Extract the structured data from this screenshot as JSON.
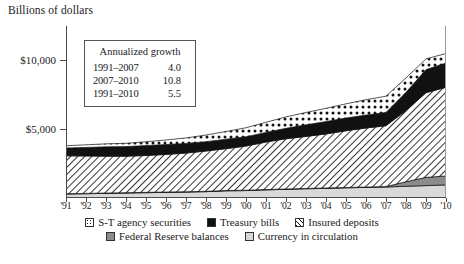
{
  "axis_title": "Billions of dollars",
  "growth_box": {
    "title": "Annualized growth",
    "rows": [
      {
        "period": "1991–2007",
        "value": "4.0"
      },
      {
        "period": "2007–2010",
        "value": "10.8"
      },
      {
        "period": "1991–2010",
        "value": "5.5"
      }
    ]
  },
  "legend": {
    "row1": [
      {
        "label": "S-T agency securities",
        "swatch": "dotted-icon"
      },
      {
        "label": "Treasury bills",
        "swatch": "black-square-icon"
      },
      {
        "label": "Insured deposits",
        "swatch": "hatch-icon"
      }
    ],
    "row2": [
      {
        "label": "Federal Reserve balances",
        "swatch": "dark-gray-square-icon"
      },
      {
        "label": "Currency in circulation",
        "swatch": "light-gray-square-icon"
      }
    ]
  },
  "chart_data": {
    "type": "area",
    "title": "",
    "xlabel": "",
    "ylabel": "Billions of dollars",
    "stacked": true,
    "grid": false,
    "legend_position": "bottom",
    "ylim": [
      0,
      12500
    ],
    "yticks": [
      5000,
      10000
    ],
    "ytick_labels": [
      "$5,000",
      "$10,000"
    ],
    "x": [
      1991,
      1992,
      1993,
      1994,
      1995,
      1996,
      1997,
      1998,
      1999,
      2000,
      2001,
      2002,
      2003,
      2004,
      2005,
      2006,
      2007,
      2008,
      2009,
      2010
    ],
    "xtick_labels": [
      "'91",
      "'92",
      "'93",
      "'94",
      "'95",
      "'96",
      "'97",
      "'98",
      "'99",
      "'00",
      "'01",
      "'02",
      "'03",
      "'04",
      "'05",
      "'06",
      "'07",
      "'08",
      "'09",
      "'10"
    ],
    "series": [
      {
        "name": "Currency in circulation",
        "fill": "light-gray",
        "values": [
          290,
          310,
          335,
          360,
          385,
          410,
          430,
          460,
          520,
          540,
          590,
          630,
          670,
          700,
          740,
          770,
          800,
          850,
          900,
          950
        ]
      },
      {
        "name": "Federal Reserve balances",
        "fill": "dark-gray",
        "values": [
          25,
          25,
          25,
          25,
          25,
          25,
          25,
          25,
          25,
          25,
          25,
          25,
          25,
          25,
          25,
          25,
          30,
          330,
          600,
          650
        ]
      },
      {
        "name": "Insured deposits",
        "fill": "diagonal-hatch",
        "values": [
          2750,
          2720,
          2680,
          2650,
          2680,
          2730,
          2810,
          2930,
          3040,
          3210,
          3450,
          3650,
          3780,
          3930,
          4120,
          4290,
          4420,
          5180,
          6150,
          6450
        ]
      },
      {
        "name": "Treasury bills",
        "fill": "black",
        "values": [
          560,
          620,
          680,
          700,
          720,
          720,
          700,
          680,
          690,
          680,
          700,
          760,
          840,
          900,
          930,
          940,
          970,
          1320,
          1680,
          1760
        ]
      },
      {
        "name": "S-T agency securities",
        "fill": "dotted",
        "values": [
          175,
          190,
          215,
          240,
          280,
          330,
          400,
          480,
          560,
          650,
          740,
          830,
          900,
          960,
          1030,
          1120,
          1180,
          1050,
          780,
          690
        ]
      }
    ],
    "totals": [
      3800,
      3865,
      3935,
      3975,
      4090,
      4215,
      4365,
      4575,
      4835,
      5105,
      5505,
      5895,
      6215,
      6515,
      6845,
      7145,
      7400,
      8730,
      10110,
      10500
    ],
    "annotations": {
      "annualized_growth": [
        {
          "period": "1991–2007",
          "rate": 4.0
        },
        {
          "period": "2007–2010",
          "rate": 10.8
        },
        {
          "period": "1991–2010",
          "rate": 5.5
        }
      ]
    }
  }
}
